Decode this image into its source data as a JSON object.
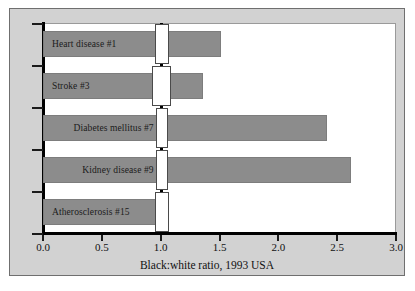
{
  "chart_data": {
    "type": "bar",
    "orientation": "horizontal",
    "title": "",
    "xlabel": "Black:white ratio, 1993 USA",
    "ylabel": "",
    "xlim": [
      0.0,
      3.0
    ],
    "xticks": [
      "0.0",
      "0.5",
      "1.0",
      "1.5",
      "2.0",
      "2.5",
      "3.0"
    ],
    "xtick_values": [
      0.0,
      0.5,
      1.0,
      1.5,
      2.0,
      2.5,
      3.0
    ],
    "grid": false,
    "legend": false,
    "reference_line": 1.0,
    "categories": [
      "Heart disease #1",
      "Stroke #3",
      "Diabetes mellitus #7",
      "Kidney disease #9",
      "Atherosclerosis #15"
    ],
    "values": [
      1.51,
      1.36,
      2.41,
      2.62,
      1.02
    ],
    "confidence_intervals": [
      {
        "low": 0.95,
        "high": 1.07
      },
      {
        "low": 0.93,
        "high": 1.09
      },
      {
        "low": 0.96,
        "high": 1.06
      },
      {
        "low": 0.96,
        "high": 1.06
      },
      {
        "low": 0.95,
        "high": 1.07
      }
    ],
    "bars": [
      {
        "label": "Heart disease #1",
        "value": 1.51,
        "ci_low": 0.95,
        "ci_high": 1.07
      },
      {
        "label": "Stroke #3",
        "value": 1.36,
        "ci_low": 0.93,
        "ci_high": 1.09
      },
      {
        "label": "Diabetes mellitus #7",
        "value": 2.41,
        "ci_low": 0.96,
        "ci_high": 1.06
      },
      {
        "label": "Kidney disease #9",
        "value": 2.62,
        "ci_low": 0.96,
        "ci_high": 1.06
      },
      {
        "label": "Atherosclerosis #15",
        "value": 1.02,
        "ci_low": 0.95,
        "ci_high": 1.07
      }
    ],
    "colors": {
      "bar_fill": "#8c8c8c",
      "bar_stroke": "#7d7d7d",
      "plot_background": "#ffffff",
      "figure_background": "#d2d2d2",
      "axis": "#000000",
      "ci_box_fill": "#ffffff",
      "text": "#111111"
    }
  }
}
